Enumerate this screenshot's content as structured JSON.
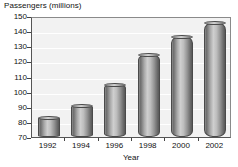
{
  "chart_data": {
    "type": "bar",
    "title": "",
    "categories": [
      "1992",
      "1994",
      "1996",
      "1998",
      "2000",
      "2002"
    ],
    "values": [
      83,
      91,
      105,
      125,
      137,
      146
    ],
    "xlabel": "Year",
    "ylabel": "Passengers (millions)",
    "ylim": [
      70,
      150
    ],
    "ytick_labels": [
      "150",
      "140",
      "130",
      "120",
      "110",
      "100",
      "90",
      "80",
      "70"
    ],
    "ytick_values": [
      150,
      140,
      130,
      120,
      110,
      100,
      90,
      80,
      70
    ],
    "grid": true,
    "legend": "none",
    "bar_style": "3d-cylinder",
    "colors": {
      "bar_light": "#cfcfcf",
      "bar_mid": "#949494",
      "bar_dark": "#585858",
      "bar_outline": "#4a4a4a",
      "plot_background": "#f2f2f2",
      "gridline": "#ffffff",
      "axis": "#555555",
      "text": "#111111"
    }
  }
}
